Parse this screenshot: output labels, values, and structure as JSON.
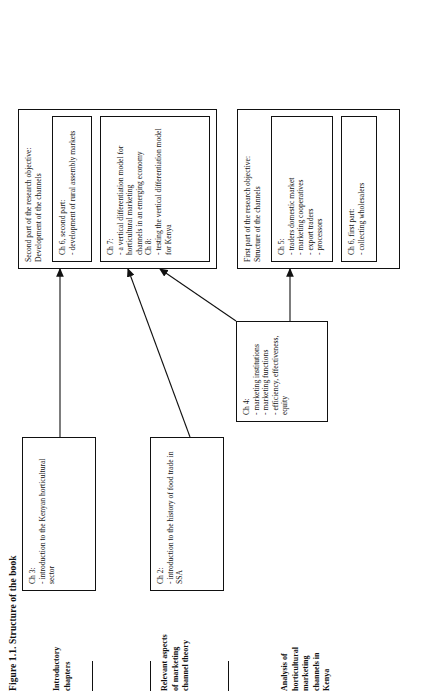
{
  "figure": {
    "title": "Figure 1.1. Structure of the book"
  },
  "row_labels": [
    {
      "id": "introductory-chapters",
      "text": "Introductory\nchapters"
    },
    {
      "id": "marketing-channel-theory",
      "text": "Relevant aspects\nof marketing\nchannel theory"
    },
    {
      "id": "analysis-kenya",
      "text": "Analysis of\nhorticultural\nmarketing\nchannels in\nKenya"
    }
  ],
  "boxes": {
    "ch2": {
      "label": "Ch 2:\n- introduction to the history of food trade in SSA"
    },
    "ch3": {
      "label": "Ch 3:\n- introduction to the Kenyan horticultural sector"
    },
    "ch4": {
      "label": "Ch 4:\n- marketing institutions\n- marketing functions\n- efficiency, effectiveness, equity"
    },
    "first_part": {
      "heading": "First part of the research objective:\nStructure of the channels",
      "ch5": "Ch 5:\n- traders domestic market\n- marketing cooperatives\n- export traders\n- processors",
      "ch6": "Ch 6, first part:\n- collecting wholesalers"
    },
    "second_part": {
      "heading": "Second part of the research objective:\nDevelopment of the channels",
      "ch6": "Ch 6, second part:\n- development of rural  assembly markets",
      "ch7_ch8": "Ch 7:\n- a vertical differentiation model  for horticultural marketing\nchannels in an emerging  economy\nCh 8:\n- testing the vertical differentiation model  for Kenya"
    }
  },
  "colors": {
    "ink": "#111111",
    "paper": "#ffffff"
  }
}
